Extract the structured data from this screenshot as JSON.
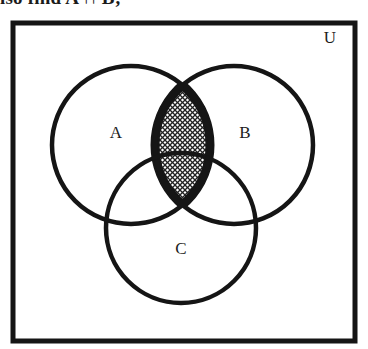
{
  "caption": {
    "text": "lso find A ∩ B;",
    "note": "partially clipped text line at very top edge of scan"
  },
  "diagram": {
    "kind": "venn-diagram",
    "set_count": 3,
    "universe": {
      "label": "U",
      "label_x": 330,
      "label_y": 43,
      "rect": {
        "x": 13,
        "y": 23,
        "width": 342,
        "height": 318
      }
    },
    "circles": [
      {
        "id": "A",
        "label": "A",
        "cx": 131,
        "cy": 145,
        "r": 79,
        "label_x": 116,
        "label_y": 138
      },
      {
        "id": "B",
        "label": "B",
        "cx": 234,
        "cy": 145,
        "r": 79,
        "label_x": 245,
        "label_y": 138
      },
      {
        "id": "C",
        "label": "C",
        "cx": 181,
        "cy": 228,
        "r": 75,
        "label_x": 181,
        "label_y": 254
      }
    ],
    "shaded_region": {
      "expression": "A ∩ B",
      "description": "lens-shaped intersection of circles A and B, filled with a crosshatch / stipple pattern, crossed by the arc of circle C",
      "fill_pattern": "crosshatch",
      "top_point_y": 92,
      "bottom_point_y": 192
    },
    "colors": {
      "ink": "#151515",
      "paper": "#ffffff",
      "hatch": "#2a2a2a"
    },
    "stroke_width": 4.5
  }
}
